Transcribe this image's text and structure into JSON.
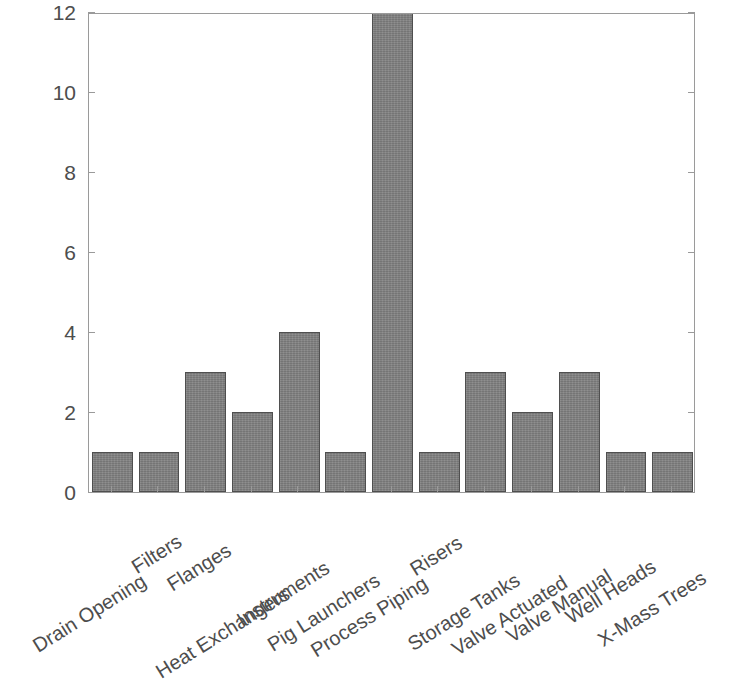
{
  "chart_data": {
    "type": "bar",
    "title": "",
    "subtitle": "",
    "xlabel": "",
    "ylabel": "",
    "categories": [
      "Drain Opening",
      "Filters",
      "Flanges",
      "Heat Exchangers",
      "Instruments",
      "Pig Launchers",
      "Process Piping",
      "Risers",
      "Storage Tanks",
      "Valve Actuated",
      "Valve Manual",
      "Well Heads",
      "X-Mass Trees"
    ],
    "values": [
      1,
      1,
      3,
      2,
      4,
      1,
      14,
      1,
      3,
      2,
      3,
      1,
      1
    ],
    "clipped_bars": [
      "Process Piping"
    ],
    "ylim": [
      0,
      12
    ],
    "ytick_labels": [
      "0",
      "2",
      "4",
      "6",
      "8",
      "10",
      "12"
    ],
    "ytick_values": [
      0,
      2,
      4,
      6,
      8,
      10,
      12
    ],
    "grid": false,
    "legend": null,
    "bar_color": "#808080",
    "bar_edge_color": "#4f4f4f",
    "axis_color": "#9a9a9a",
    "text_color": "#4d4d4d",
    "background_color": "#ffffff",
    "x_label_rotation_deg": -32
  }
}
